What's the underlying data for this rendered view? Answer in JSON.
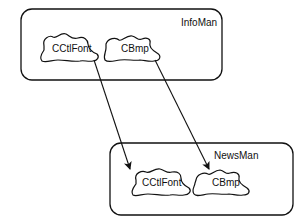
{
  "diagram": {
    "groups": [
      {
        "id": "infoman",
        "label": "InfoMan",
        "components": [
          {
            "id": "infoman-cctlfont",
            "label": "CCtlFont"
          },
          {
            "id": "infoman-cbmp",
            "label": "CBmp"
          }
        ]
      },
      {
        "id": "newsman",
        "label": "NewsMan",
        "components": [
          {
            "id": "newsman-cctlfont",
            "label": "CCtlFont"
          },
          {
            "id": "newsman-cbmp",
            "label": "CBmp"
          }
        ]
      }
    ],
    "arrows": [
      {
        "from": "infoman-cctlfont",
        "to": "newsman-cctlfont"
      },
      {
        "from": "infoman-cbmp",
        "to": "newsman-cbmp"
      }
    ],
    "colors": {
      "stroke": "#111111",
      "background": "#ffffff"
    }
  }
}
